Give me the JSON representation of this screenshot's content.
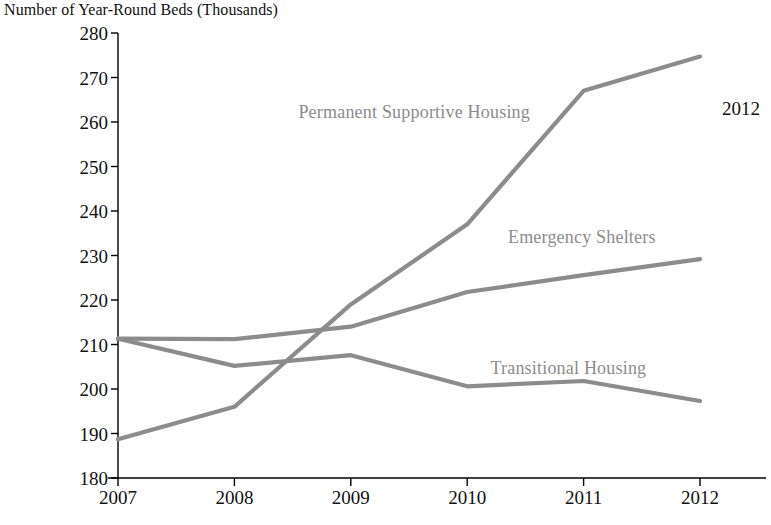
{
  "chart_data": {
    "type": "line",
    "title": "Number of Year-Round Beds (Thousands)",
    "xlabel": "",
    "ylabel": "Number of Year-Round Beds (Thousands)",
    "categories": [
      "2007",
      "2008",
      "2009",
      "2010",
      "2011",
      "2012"
    ],
    "x": [
      2007,
      2008,
      2009,
      2010,
      2011,
      2012
    ],
    "ylim": [
      180,
      280
    ],
    "yticks": [
      180,
      190,
      200,
      210,
      220,
      230,
      240,
      250,
      260,
      270,
      280
    ],
    "grid": false,
    "legend_position": "inline-labels",
    "series": [
      {
        "name": "Permanent Supportive Housing",
        "values": [
          188.7,
          196.0,
          219.0,
          237.0,
          267.0,
          274.7
        ],
        "color": "#8c8c8c",
        "label_x": 2008.55,
        "label_y": 262.0
      },
      {
        "name": "Emergency Shelters",
        "values": [
          211.3,
          211.2,
          214.0,
          221.8,
          225.6,
          229.2
        ],
        "color": "#8c8c8c",
        "label_x": 2010.35,
        "label_y": 234.0
      },
      {
        "name": "Transitional Housing",
        "values": [
          211.3,
          205.2,
          207.6,
          200.6,
          201.8,
          197.3
        ],
        "color": "#8c8c8c",
        "label_x": 2010.2,
        "label_y": 204.5
      }
    ],
    "annotations": [
      {
        "text": "2012",
        "x_px": 722,
        "y_px": 110
      }
    ]
  },
  "axis": {
    "y_tick_labels": [
      "280",
      "270",
      "260",
      "250",
      "240",
      "230",
      "220",
      "210",
      "200",
      "190",
      "180"
    ],
    "x_tick_labels": [
      "2007",
      "2008",
      "2009",
      "2010",
      "2011",
      "2012"
    ]
  },
  "series_labels": {
    "permanent_supportive_housing": "Permanent Supportive Housing",
    "emergency_shelters": "Emergency Shelters",
    "transitional_housing": "Transitional Housing"
  },
  "colors": {
    "line": "#8c8c8c",
    "axis": "#000000",
    "text": "#111111",
    "series_label": "#8c8c8c"
  }
}
